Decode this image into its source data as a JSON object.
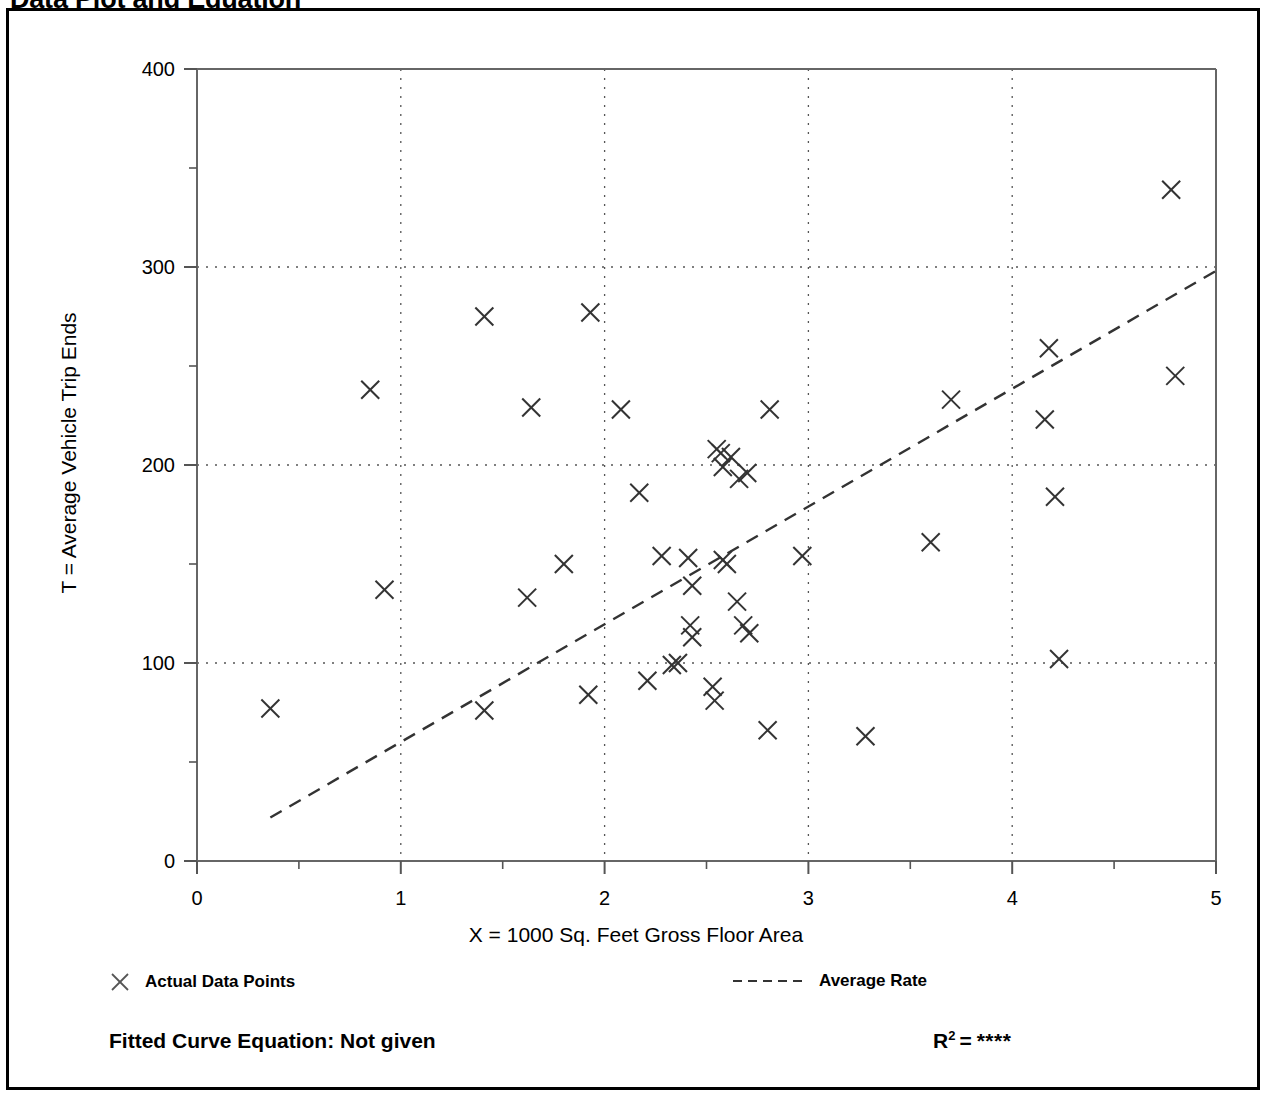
{
  "page": {
    "title": "Data Plot and Equation"
  },
  "legend": {
    "data_points_label": "Actual Data Points",
    "average_rate_label": "Average Rate",
    "point_marker_icon": "x-marker-icon",
    "line_marker_icon": "dashed-line-icon"
  },
  "equation": {
    "label": "Fitted Curve Equation:  Not given",
    "r2_symbol": "R",
    "r2_exponent": "2",
    "r2_equals": "=",
    "r2_value": "****"
  },
  "chart_data": {
    "type": "scatter",
    "title": "Data Plot and Equation",
    "xlabel": "X = 1000 Sq. Feet Gross Floor Area",
    "ylabel": "T = Average Vehicle Trip Ends",
    "xlim": [
      0,
      5
    ],
    "ylim": [
      0,
      400
    ],
    "xticks": [
      0,
      1,
      2,
      3,
      4,
      5
    ],
    "yticks": [
      0,
      100,
      200,
      300,
      400
    ],
    "xtick_labels": [
      "0",
      "1",
      "2",
      "3",
      "4",
      "5"
    ],
    "ytick_labels": [
      "0",
      "100",
      "200",
      "300",
      "400"
    ],
    "x_minor_step": 0.5,
    "y_minor_step": 50,
    "grid": true,
    "grid_style": "dotted",
    "legend_position": "below",
    "marker": "x",
    "marker_color": "#333333",
    "series": [
      {
        "name": "Actual Data Points",
        "type": "scatter",
        "points": [
          [
            0.36,
            77
          ],
          [
            0.85,
            238
          ],
          [
            0.92,
            137
          ],
          [
            1.41,
            76
          ],
          [
            1.41,
            275
          ],
          [
            1.62,
            133
          ],
          [
            1.64,
            229
          ],
          [
            1.8,
            150
          ],
          [
            1.92,
            84
          ],
          [
            1.93,
            277
          ],
          [
            2.08,
            228
          ],
          [
            2.17,
            186
          ],
          [
            2.21,
            91
          ],
          [
            2.28,
            154
          ],
          [
            2.33,
            99
          ],
          [
            2.36,
            100
          ],
          [
            2.41,
            153
          ],
          [
            2.42,
            119
          ],
          [
            2.43,
            139
          ],
          [
            2.43,
            113
          ],
          [
            2.53,
            88
          ],
          [
            2.54,
            81
          ],
          [
            2.55,
            208
          ],
          [
            2.57,
            206
          ],
          [
            2.58,
            199
          ],
          [
            2.58,
            152
          ],
          [
            2.6,
            150
          ],
          [
            2.62,
            204
          ],
          [
            2.65,
            131
          ],
          [
            2.66,
            193
          ],
          [
            2.68,
            119
          ],
          [
            2.7,
            196
          ],
          [
            2.71,
            115
          ],
          [
            2.8,
            66
          ],
          [
            2.81,
            228
          ],
          [
            2.97,
            154
          ],
          [
            3.28,
            63
          ],
          [
            3.6,
            161
          ],
          [
            3.7,
            233
          ],
          [
            4.16,
            223
          ],
          [
            4.18,
            259
          ],
          [
            4.21,
            184
          ],
          [
            4.23,
            102
          ],
          [
            4.78,
            339
          ],
          [
            4.8,
            245
          ]
        ]
      },
      {
        "name": "Average Rate",
        "type": "line",
        "style": "dashed",
        "endpoints": [
          [
            0.36,
            22
          ],
          [
            5.0,
            298
          ]
        ]
      }
    ]
  }
}
